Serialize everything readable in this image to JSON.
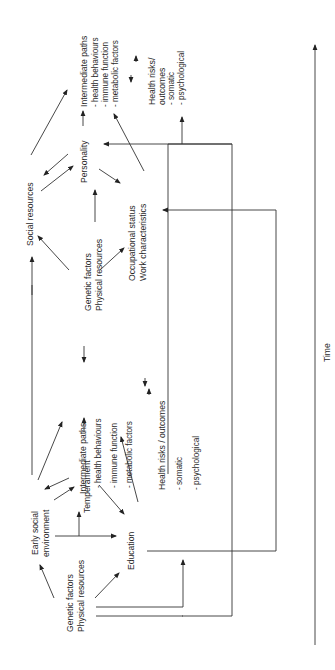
{
  "diagram": {
    "orientation": "rotated 90 degrees counter-clockwise",
    "axis": {
      "label": "Time"
    },
    "stage1": {
      "genetic": [
        "Genetic factors",
        "Physical resources"
      ],
      "early_social": [
        "Early social",
        "environment"
      ],
      "temperament": "Temperament",
      "education": "Education",
      "intermediate": [
        "Intermediate paths",
        "- health behaviours",
        "- immune function",
        "- metabolic factors"
      ],
      "health": [
        "Health risks / outcomes",
        "- somatic",
        "- psychological"
      ]
    },
    "stage2": {
      "genetic": [
        "Genetic factors",
        "Physical resources"
      ],
      "social": "Social  resources",
      "personality": "Personality",
      "occupational": [
        "Occupational status",
        "Work characteristics"
      ],
      "intermediate": [
        "Intermediate paths",
        "- health behaviours",
        "- immune function",
        "- metabolic factors"
      ],
      "health": [
        "Health risks/",
        "outcomes",
        "- somatic",
        "- psychological"
      ]
    }
  }
}
